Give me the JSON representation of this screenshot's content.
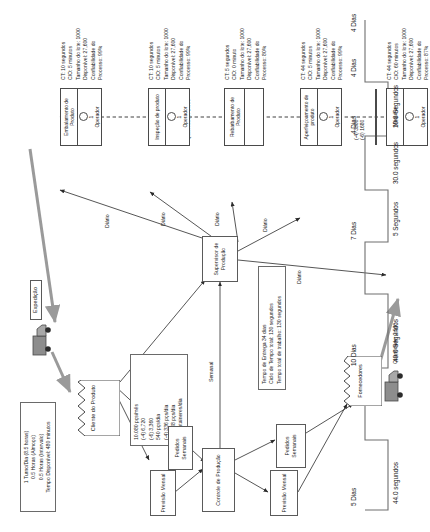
{
  "diagram": {
    "shift_info": {
      "lines": [
        "1 Turno/Dia (8.5 horas)",
        "0.5 Horas (Almoço)",
        "0.5 Horas (Intervalo)",
        "Tempo Disponível: 480 minutos"
      ]
    },
    "demand_info": {
      "lines": [
        "10.080 pçs/mês",
        "(-4) 6,720",
        "(-6) 3,360",
        "540 pçs/dia",
        "(-4) 336 pçs/dia",
        "(-6) 168 pçs/dia",
        "12 containeres/dia"
      ]
    },
    "summary_info": {
      "lines": [
        "Tempo de Entrega 34 dias",
        "Ciclo de Tempo total: 130 segundos",
        "Tempo total de trabalho: 130 segundos"
      ]
    },
    "entities": {
      "customer": "Cliente do Produto",
      "suppliers": "Fornecedores",
      "production_control": "Controle de Produção",
      "production_supervisor": "Supervisor de Produção",
      "shipping": "Expedição"
    },
    "info_boxes": {
      "monthly_forecast_top": "Previsão Mensal",
      "weekly_orders_top": "Pedidos Semanais",
      "monthly_forecast_bottom": "Previsão Mensal",
      "weekly_orders_bottom": "Pedidos Semanais"
    },
    "flow_labels": {
      "weekly": "Semanal",
      "daily_1": "Diário",
      "daily_2": "Diário",
      "daily_3": "Diário",
      "daily_4": "Diário",
      "daily_5": "Diário"
    },
    "inventory": {
      "suppliers_qty": "Quantidade: 2.500",
      "machine_out": "(-4) 3300\n(-6) 1680",
      "inspection_in": "Quantidade: 2.000"
    },
    "processes": [
      {
        "name": "Máquina",
        "operators": "1",
        "operator_label": "Operador",
        "data": [
          "CT: 44 segundos",
          "C/O: 60 minutos",
          "Tamanho do lote: 1000",
          "Disponível: 27,600",
          "Confiabilidade do",
          "Processo: 87%"
        ]
      },
      {
        "name": "Aperfeiçoamento de produto",
        "operators": "1",
        "operator_label": "Operador",
        "data": [
          "CT: 44 segundos",
          "C/O: 5 minutos",
          "Tamanho do lote: 1000",
          "Disponível: 27,600",
          "Confiabilidade do",
          "Processo: 99%"
        ]
      },
      {
        "name": "Rebarbamento de Produto",
        "operators": "",
        "operator_label": "",
        "data": [
          "CT: 5 segundos",
          "C/O: 0 minuto",
          "Tamanho do lote: 1000",
          "Disponível: 27,600",
          "Confiabilidade do",
          "Processo: 80%"
        ]
      },
      {
        "name": "Inspeção de produto",
        "operators": "1",
        "operator_label": "Operador",
        "data": [
          "CT: 10 segundos",
          "C/O: 5 minutos",
          "Tamanho do lote: 1000",
          "Disponível: 27,600",
          "Confiabilidade do",
          "Processo: 99%"
        ]
      },
      {
        "name": "Embalamento de Produto",
        "operators": "1",
        "operator_label": "Operador",
        "data": [
          "CT: 10 segundos",
          "C/O: 5 minutos",
          "Tamanho do lote: 1000",
          "Disponível: 27,600",
          "Confiabilidade do",
          "Processo: 99%"
        ]
      }
    ],
    "timeline": {
      "lead_times": [
        "5 Dias",
        "10 Dias",
        "7 Dias",
        "4 Dias",
        "4 Dias",
        "4 Dias"
      ],
      "process_times": [
        "44.0 segundos",
        "40.0 Segundos",
        "5 Segundos",
        "30.0 segundos",
        "10.0 Segundos"
      ]
    }
  }
}
